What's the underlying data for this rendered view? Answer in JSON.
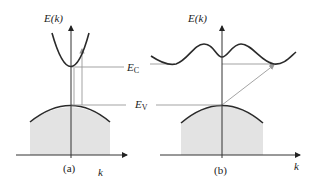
{
  "colors": {
    "curve": "#2a2a2a",
    "axis": "#333333",
    "guide": "#999999",
    "fill": "#e3e3e3",
    "background": "#ffffff"
  },
  "panels": [
    {
      "id": "a",
      "caption": "(a)",
      "y_axis_label": "E(k)",
      "x_axis_label": "k",
      "conduction_label": "E",
      "conduction_sub": "C",
      "valence_label": "E",
      "valence_sub": "V",
      "band_type": "direct"
    },
    {
      "id": "b",
      "caption": "(b)",
      "y_axis_label": "E(k)",
      "x_axis_label": "k",
      "band_type": "indirect"
    }
  ]
}
